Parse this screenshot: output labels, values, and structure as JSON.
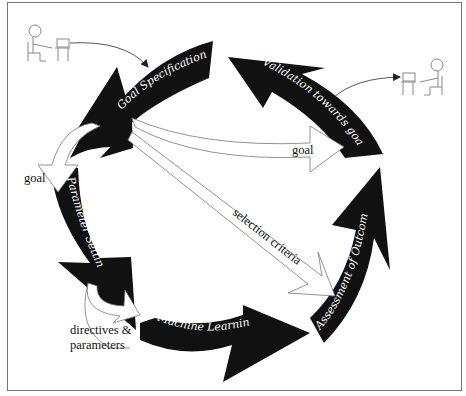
{
  "diagram": {
    "cycle_steps": [
      {
        "id": "goal-specification",
        "label": "Goal Specification"
      },
      {
        "id": "parameter-setting",
        "label": "Parameter Setting"
      },
      {
        "id": "machine-learning",
        "label": "Machine Learning"
      },
      {
        "id": "assessment-of-outcome",
        "label": "Assessment of Outcome"
      },
      {
        "id": "validation-towards-goal",
        "label": "Validation towards goal"
      }
    ],
    "flows": [
      {
        "id": "goal-to-parameter",
        "label": "goal"
      },
      {
        "id": "goal-to-validation",
        "label": "goal"
      },
      {
        "id": "selection-criteria",
        "label": "selection criteria"
      },
      {
        "id": "directives-parameters",
        "label_line1": "directives &",
        "label_line2": "parameters"
      }
    ],
    "actors": [
      {
        "id": "user-left",
        "icon": "person-at-computer-icon"
      },
      {
        "id": "user-right",
        "icon": "person-at-computer-icon"
      }
    ],
    "colors": {
      "arrow_fill": "#111111",
      "arrow_text": "#ffffff",
      "outline": "#777777",
      "background": "#ffffff"
    }
  }
}
